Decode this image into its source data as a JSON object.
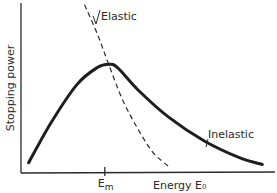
{
  "chart_data": {
    "type": "line",
    "title": "",
    "xlabel": "Energy E₀",
    "ylabel": "Stopping power",
    "x_ticks": [
      {
        "label": "E",
        "subscript": "m",
        "x": 0.33
      }
    ],
    "xlim": [
      0,
      1
    ],
    "ylim": [
      0,
      1
    ],
    "grid": false,
    "legend": "none",
    "series": [
      {
        "name": "Inelastic",
        "style": "solid",
        "points": [
          [
            0.03,
            0.06
          ],
          [
            0.12,
            0.3
          ],
          [
            0.22,
            0.52
          ],
          [
            0.3,
            0.62
          ],
          [
            0.345,
            0.64
          ],
          [
            0.38,
            0.62
          ],
          [
            0.46,
            0.49
          ],
          [
            0.58,
            0.33
          ],
          [
            0.72,
            0.19
          ],
          [
            0.86,
            0.09
          ],
          [
            0.95,
            0.05
          ]
        ]
      },
      {
        "name": "Elastic",
        "style": "dashed",
        "points": [
          [
            0.25,
            0.99
          ],
          [
            0.3,
            0.82
          ],
          [
            0.345,
            0.64
          ],
          [
            0.4,
            0.43
          ],
          [
            0.46,
            0.26
          ],
          [
            0.52,
            0.12
          ],
          [
            0.58,
            0.04
          ]
        ]
      }
    ],
    "annotations": [
      {
        "text": "Elastic",
        "target_series": "Elastic"
      },
      {
        "text": "Inelastic",
        "target_series": "Inelastic"
      }
    ]
  }
}
